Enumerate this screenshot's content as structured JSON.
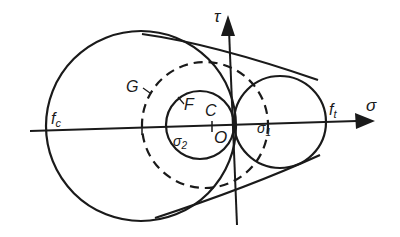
{
  "diagram": {
    "type": "Mohr circles with failure envelope",
    "axes": {
      "horizontal": {
        "label": "σ"
      },
      "vertical": {
        "label": "τ"
      }
    },
    "labels": {
      "origin": "O",
      "center": "C",
      "circle_G": "G",
      "circle_F": "F",
      "compressive_strength": "f",
      "compressive_strength_sub": "c",
      "tensile_strength": "f",
      "tensile_strength_sub": "t",
      "sigma_1": "σ",
      "sigma_1_sub": "1",
      "sigma_2": "σ",
      "sigma_2_sub": "2"
    },
    "elements": [
      {
        "name": "large compression circle",
        "style": "solid"
      },
      {
        "name": "circle G",
        "style": "dashed"
      },
      {
        "name": "circle F",
        "style": "solid"
      },
      {
        "name": "tension circle",
        "style": "solid"
      },
      {
        "name": "upper envelope tangent",
        "style": "solid"
      },
      {
        "name": "lower envelope tangent",
        "style": "solid"
      }
    ],
    "colors": {
      "ink": "#1a1a1a",
      "background": "#ffffff"
    }
  }
}
